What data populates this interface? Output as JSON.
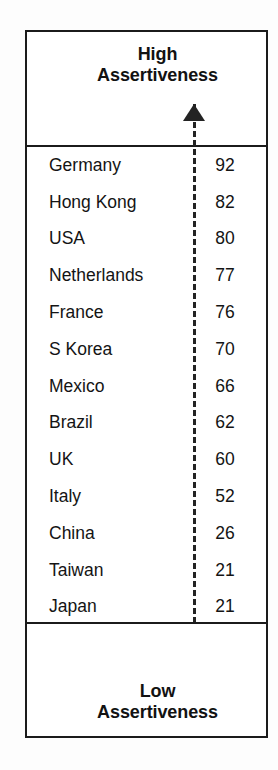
{
  "figure": {
    "header_label_line1": "High",
    "header_label_line2": "Assertiveness",
    "footer_label_line1": "Low",
    "footer_label_line2": "Assertiveness",
    "axis_up_arrow_icon": "arrow-up-icon",
    "axis_down_arrow_icon": "arrow-down-icon",
    "axis_style": "dashed",
    "ink_color": "#1b1b1b",
    "background_color": "#ffffff"
  },
  "chart_data": {
    "type": "table",
    "xlabel": "",
    "ylabel": "Assertiveness",
    "axis_top_label": "High Assertiveness",
    "axis_bottom_label": "Low Assertiveness",
    "grid": false,
    "legend": "none",
    "ylim": [
      21,
      92
    ],
    "categories": [
      "Germany",
      "Hong Kong",
      "USA",
      "Netherlands",
      "France",
      "S Korea",
      "Mexico",
      "Brazil",
      "UK",
      "Italy",
      "China",
      "Taiwan",
      "Japan"
    ],
    "values": [
      92,
      82,
      80,
      77,
      76,
      70,
      66,
      62,
      60,
      52,
      26,
      21,
      21
    ],
    "rows": [
      {
        "country": "Germany",
        "score": "92"
      },
      {
        "country": "Hong Kong",
        "score": "82"
      },
      {
        "country": "USA",
        "score": "80"
      },
      {
        "country": "Netherlands",
        "score": "77"
      },
      {
        "country": "France",
        "score": "76"
      },
      {
        "country": "S Korea",
        "score": "70"
      },
      {
        "country": "Mexico",
        "score": "66"
      },
      {
        "country": "Brazil",
        "score": "62"
      },
      {
        "country": "UK",
        "score": "60"
      },
      {
        "country": "Italy",
        "score": "52"
      },
      {
        "country": "China",
        "score": "26"
      },
      {
        "country": "Taiwan",
        "score": "21"
      },
      {
        "country": "Japan",
        "score": "21"
      }
    ]
  }
}
